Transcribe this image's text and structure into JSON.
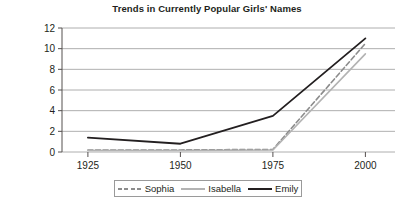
{
  "chart_data": {
    "type": "line",
    "title": "Trends in Currently Popular Girls' Names",
    "xlabel": "",
    "ylabel": "Per thousand",
    "x": [
      1925,
      1950,
      1975,
      2000
    ],
    "categories": [
      "1925",
      "1950",
      "1975",
      "2000"
    ],
    "xlim": [
      1918,
      2008
    ],
    "ylim": [
      0,
      12
    ],
    "yticks": [
      0,
      2,
      4,
      6,
      8,
      10,
      12
    ],
    "ytick_labels": [
      "0",
      "2",
      "4",
      "6",
      "8",
      "10",
      "12"
    ],
    "xtick_labels": [
      "1925",
      "1950",
      "1975",
      "2000"
    ],
    "grid": true,
    "grid_axis": "y",
    "legend_position": "bottom",
    "series": [
      {
        "name": "Sophia",
        "values": [
          0.2,
          0.2,
          0.25,
          10.5
        ],
        "color": "#8c8c8c",
        "style": "dashed",
        "width": 1.6
      },
      {
        "name": "Isabella",
        "values": [
          0.15,
          0.15,
          0.2,
          9.5
        ],
        "color": "#b3b3b3",
        "style": "solid",
        "width": 1.6
      },
      {
        "name": "Emily",
        "values": [
          1.4,
          0.8,
          3.5,
          11.0
        ],
        "color": "#231f20",
        "style": "solid",
        "width": 1.8
      }
    ]
  },
  "colors": {
    "background": "#ffffff",
    "text": "#231f20",
    "gridline": "#9a9a9a",
    "axis": "#55504f",
    "legend_border": "#9a9a9a"
  }
}
